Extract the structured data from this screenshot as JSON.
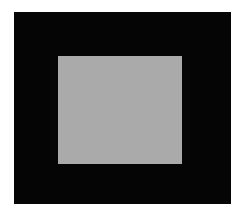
{
  "canvas": {
    "background": "#ffffff",
    "outer_square": {
      "color": "#050505"
    },
    "inner_square": {
      "color": "#aaaaaa"
    }
  }
}
